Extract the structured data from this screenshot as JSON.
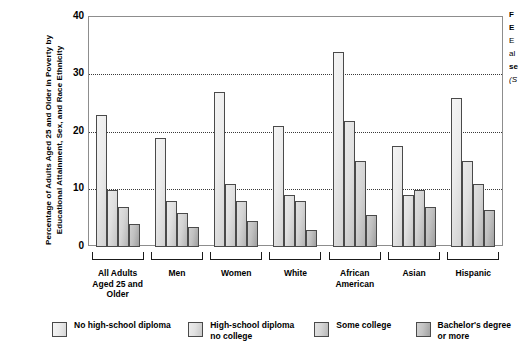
{
  "chart_data": {
    "type": "bar",
    "title": "",
    "xlabel": "",
    "ylabel": "Percentage of Adults Aged 25 and Older in Poverty by Educational Attainment, Sex, and Race Ethnicity",
    "ylim": [
      0,
      40
    ],
    "yticks": [
      "0",
      "10",
      "20",
      "30",
      "40"
    ],
    "grid": "horizontal-dotted",
    "legend_position": "bottom",
    "categories": [
      "All Adults Aged 25 and Older",
      "Men",
      "Women",
      "White",
      "African American",
      "Asian",
      "Hispanic"
    ],
    "series": [
      {
        "name": "No high-school diploma",
        "values": [
          23,
          19,
          27,
          21,
          34,
          17.5,
          26
        ]
      },
      {
        "name": "High-school diploma no college",
        "values": [
          10,
          8,
          11,
          9,
          22,
          9,
          15
        ]
      },
      {
        "name": "Some college",
        "values": [
          7,
          6,
          8,
          8,
          15,
          10,
          11
        ]
      },
      {
        "name": "Bachelor's degree or more",
        "values": [
          4,
          3.5,
          4.5,
          3,
          5.5,
          7,
          6.5
        ]
      }
    ]
  },
  "axis": {
    "y_title": "Percentage of Adults Aged 25 and Older in Poverty by Educational Attainment, Sex, and Race Ethnicity",
    "ticks": [
      {
        "label": "40",
        "value": 40
      },
      {
        "label": "30",
        "value": 30
      },
      {
        "label": "20",
        "value": 20
      },
      {
        "label": "10",
        "value": 10
      },
      {
        "label": "0",
        "value": 0
      }
    ]
  },
  "groups": [
    {
      "label": "All Adults\nAged 25\nand Older"
    },
    {
      "label": "Men"
    },
    {
      "label": "Women"
    },
    {
      "label": "White"
    },
    {
      "label": "African\nAmerican"
    },
    {
      "label": "Asian"
    },
    {
      "label": "Hispanic"
    }
  ],
  "legend": {
    "items": [
      {
        "label": "No high-school diploma"
      },
      {
        "label": "High-school diploma\nno college"
      },
      {
        "label": "Some college"
      },
      {
        "label": "Bachelor's degree\nor more"
      }
    ]
  },
  "caption": {
    "lines": [
      "F",
      "E",
      "E",
      "al",
      "se",
      "(S"
    ]
  },
  "colors": {
    "series_1": "#ededed",
    "series_2": "#e2e2e2",
    "series_3": "#d6d6d6",
    "series_4": "#c3c3c3",
    "axis": "#8d8d8d",
    "grid": "#3a3a3a",
    "text": "#000000"
  }
}
